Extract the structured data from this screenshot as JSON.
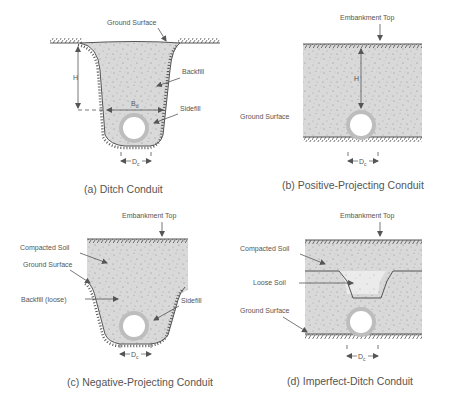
{
  "colors": {
    "soil_fill": "#d9d9d9",
    "loose_fill": "#ebebeb",
    "line": "#555555",
    "text": "#555555",
    "pipe_ring": "#bdbdbd",
    "pipe_inner": "#ffffff"
  },
  "panels": [
    {
      "id": "a",
      "caption": "(a) Ditch Conduit",
      "labels": {
        "ground_surface": "Ground Surface",
        "backfill": "Backfill",
        "sidefill": "Sidefill",
        "height": "H",
        "ditch_width": "B",
        "ditch_width_sub": "d",
        "diameter": "D",
        "diameter_sub": "c"
      }
    },
    {
      "id": "b",
      "caption": "(b) Positive-Projecting Conduit",
      "labels": {
        "embankment_top": "Embankment Top",
        "ground_surface": "Ground Surface",
        "height": "H",
        "diameter": "D",
        "diameter_sub": "c"
      }
    },
    {
      "id": "c",
      "caption": "(c) Negative-Projecting Conduit",
      "labels": {
        "embankment_top": "Embankment Top",
        "compacted_soil": "Compacted Soil",
        "ground_surface": "Ground Surface",
        "backfill_loose": "Backfill (loose)",
        "sidefill": "Sidefill",
        "diameter": "D",
        "diameter_sub": "c"
      }
    },
    {
      "id": "d",
      "caption": "(d) Imperfect-Ditch Conduit",
      "labels": {
        "embankment_top": "Embankment Top",
        "compacted_soil": "Compacted Soil",
        "loose_soil": "Loose Soil",
        "ground_surface": "Ground Surface",
        "diameter": "D",
        "diameter_sub": "c"
      }
    }
  ]
}
